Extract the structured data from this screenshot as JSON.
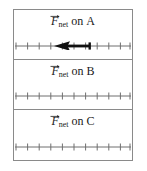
{
  "figure": {
    "colors": {
      "border": "#8a8a8a",
      "axis": "#6f6f6f",
      "arrow": "#111111",
      "text": "#1a1a1a",
      "background": "#ffffff"
    }
  },
  "panels": [
    {
      "id": "A",
      "label": {
        "symbol": "F",
        "subscript": "net",
        "connector": "on",
        "object": "A",
        "full_text": "F net on A"
      },
      "axis": {
        "tick_count": 11,
        "length_px": 116,
        "tick_height_px": 7
      },
      "vector": {
        "present": true,
        "direction": "left",
        "magnitude_ticks": 3,
        "tail_x_px": 88,
        "head_x_px": 55,
        "shaft_thickness_px": 3
      }
    },
    {
      "id": "B",
      "label": {
        "symbol": "F",
        "subscript": "net",
        "connector": "on",
        "object": "B",
        "full_text": "F net on B"
      },
      "axis": {
        "tick_count": 11,
        "length_px": 116,
        "tick_height_px": 7
      },
      "vector": {
        "present": false,
        "direction": "",
        "magnitude_ticks": 0
      }
    },
    {
      "id": "C",
      "label": {
        "symbol": "F",
        "subscript": "net",
        "connector": "on",
        "object": "C",
        "full_text": "F net on C"
      },
      "axis": {
        "tick_count": 11,
        "length_px": 116,
        "tick_height_px": 7
      },
      "vector": {
        "present": false,
        "direction": "",
        "magnitude_ticks": 0
      }
    }
  ]
}
